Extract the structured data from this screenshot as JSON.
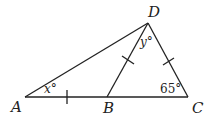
{
  "diagram": {
    "type": "geometry-triangle",
    "points": {
      "A": {
        "label": "A",
        "x": 25,
        "y": 97
      },
      "B": {
        "label": "B",
        "x": 107,
        "y": 97
      },
      "C": {
        "label": "C",
        "x": 188,
        "y": 97
      },
      "D": {
        "label": "D",
        "x": 148,
        "y": 23
      }
    },
    "segments": [
      "AB",
      "BC",
      "CD",
      "DA",
      "DB"
    ],
    "tick_marks": [
      "AB",
      "BD",
      "DC"
    ],
    "angles": {
      "x": {
        "label": "x°",
        "vertex": "A"
      },
      "y": {
        "label": "y°",
        "vertex": "D"
      },
      "C": {
        "label": "65°",
        "vertex": "C"
      }
    },
    "stroke_color": "#222222"
  }
}
